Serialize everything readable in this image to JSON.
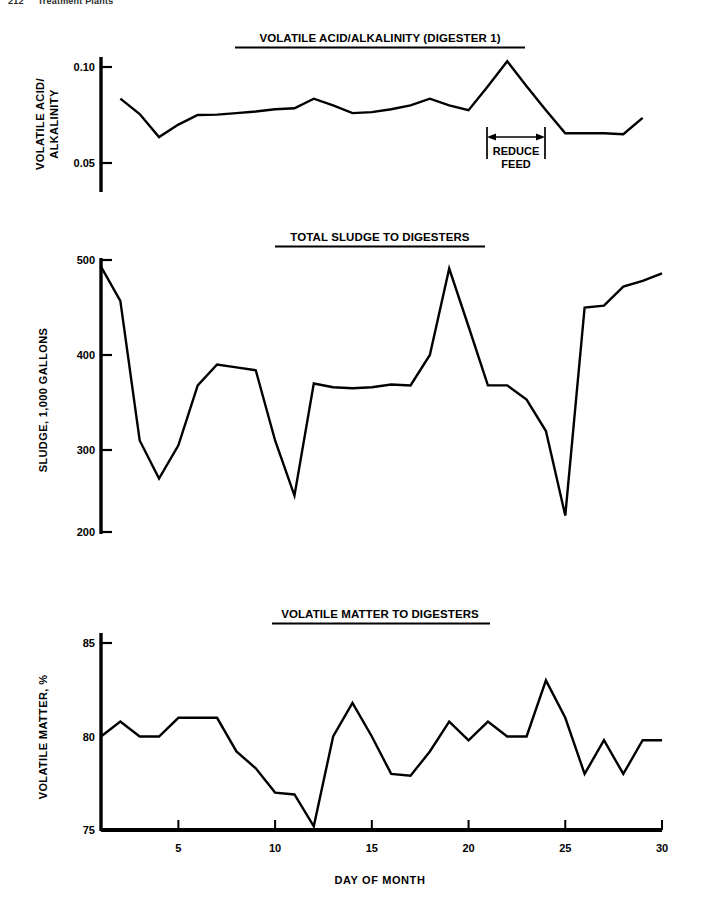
{
  "page": {
    "running_head": {
      "folio": "212",
      "title": "Treatment Plants"
    }
  },
  "x_axis": {
    "label": "DAY OF MONTH",
    "ticks": [
      5,
      10,
      15,
      20,
      25,
      30
    ],
    "min": 1,
    "max": 30
  },
  "charts": [
    {
      "id": "volatile-acid-alkalinity",
      "title": "VOLATILE ACID/ALKALINITY (DIGESTER 1)",
      "y_label_line1": "VOLATILE ACID/",
      "y_label_line2": "ALKALINITY",
      "y_ticks": [
        "0.10",
        "0.05"
      ],
      "annotation": {
        "line1": "REDUCE",
        "line2": "FEED"
      }
    },
    {
      "id": "total-sludge-to-digesters",
      "title": "TOTAL SLUDGE TO DIGESTERS",
      "y_label_line1": "SLUDGE, 1,000 GALLONS",
      "y_label_line2": "",
      "y_ticks": [
        "500",
        "400",
        "300",
        "200"
      ]
    },
    {
      "id": "volatile-matter-to-digesters",
      "title": "VOLATILE MATTER TO DIGESTERS",
      "y_label_line1": "VOLATILE MATTER, %",
      "y_label_line2": "",
      "y_ticks": [
        "85",
        "80",
        "75"
      ]
    }
  ],
  "chart_data": [
    {
      "type": "line",
      "title": "VOLATILE ACID/ALKALINITY (DIGESTER 1)",
      "xlabel": "DAY OF MONTH",
      "ylabel": "VOLATILE ACID/ALKALINITY",
      "xlim": [
        1,
        30
      ],
      "ylim": [
        0.043,
        0.108
      ],
      "yticks": [
        0.1,
        0.05
      ],
      "xticks": [
        5,
        10,
        15,
        20,
        25,
        30
      ],
      "grid": false,
      "legend": "none",
      "x": [
        2,
        3,
        4,
        5,
        6,
        7,
        8,
        9,
        10,
        11,
        12,
        13,
        14,
        15,
        16,
        17,
        18,
        19,
        20,
        21,
        22,
        23,
        24,
        25,
        26,
        27,
        28,
        29
      ],
      "values": [
        0.0835,
        0.0755,
        0.0635,
        0.07,
        0.075,
        0.0752,
        0.076,
        0.0768,
        0.078,
        0.0785,
        0.0835,
        0.08,
        0.076,
        0.0765,
        0.078,
        0.08,
        0.0835,
        0.08,
        0.0775,
        0.09,
        0.103,
        0.09,
        0.0775,
        0.0655,
        0.0655,
        0.0655,
        0.065,
        0.0735
      ],
      "annotations": [
        {
          "text": "REDUCE FEED",
          "type": "span-arrow",
          "x_start": 21,
          "x_end": 24,
          "y": 0.0615
        }
      ]
    },
    {
      "type": "line",
      "title": "TOTAL SLUDGE TO DIGESTERS",
      "xlabel": "DAY OF MONTH",
      "ylabel": "SLUDGE, 1,000 GALLONS",
      "xlim": [
        1,
        30
      ],
      "ylim": [
        195,
        510
      ],
      "yticks": [
        500,
        400,
        300,
        200
      ],
      "xticks": [
        5,
        10,
        15,
        20,
        25,
        30
      ],
      "grid": false,
      "legend": "none",
      "x": [
        1,
        2,
        3,
        4,
        5,
        6,
        7,
        8,
        9,
        10,
        11,
        12,
        13,
        14,
        15,
        16,
        17,
        18,
        19,
        20,
        21,
        22,
        23,
        24,
        25,
        26,
        27,
        28,
        29,
        30
      ],
      "values": [
        493,
        457,
        310,
        270,
        305,
        368,
        390,
        387,
        384,
        310,
        252,
        370,
        366,
        365,
        366,
        369,
        368,
        400,
        491,
        430,
        368,
        368,
        353,
        320,
        231,
        450,
        452,
        472,
        478,
        486
      ]
    },
    {
      "type": "line",
      "title": "VOLATILE MATTER TO DIGESTERS",
      "xlabel": "DAY OF MONTH",
      "ylabel": "VOLATILE MATTER, %",
      "xlim": [
        1,
        30
      ],
      "ylim": [
        75,
        85.6
      ],
      "yticks": [
        85,
        80,
        75
      ],
      "xticks": [
        5,
        10,
        15,
        20,
        25,
        30
      ],
      "grid": false,
      "legend": "none",
      "x": [
        1,
        2,
        3,
        4,
        5,
        6,
        7,
        8,
        9,
        10,
        11,
        12,
        13,
        14,
        15,
        16,
        17,
        18,
        19,
        20,
        21,
        22,
        23,
        24,
        25,
        26,
        27,
        28,
        29,
        30
      ],
      "values": [
        80.0,
        80.8,
        80.0,
        80.0,
        81.0,
        81.0,
        81.0,
        79.2,
        78.3,
        77.0,
        76.9,
        75.2,
        80.0,
        81.8,
        80.0,
        78.0,
        77.9,
        79.2,
        80.8,
        79.8,
        80.8,
        80.0,
        80.0,
        83.0,
        81.0,
        78.0,
        79.8,
        78.0,
        79.8,
        79.8
      ]
    }
  ],
  "colors": {
    "ink": "#000000",
    "paper": "#ffffff",
    "running_head": "#2b2b2b"
  }
}
